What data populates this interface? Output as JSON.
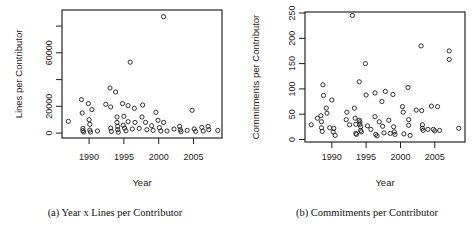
{
  "figure": {
    "background": "#ffffff",
    "ink_color": "#1c1c1c",
    "marker": "open-circle"
  },
  "chart_data": [
    {
      "type": "scatter",
      "caption": "(a) Year x Lines per Contributor",
      "xlabel": "Year",
      "ylabel": "Lines per Contributor",
      "xlim": [
        1986.1,
        2009.1
      ],
      "ylim": [
        -3700,
        92000
      ],
      "xticks": [
        1990,
        1995,
        2000,
        2005
      ],
      "xtick_labels": [
        "1990",
        "1995",
        "2000",
        "2005"
      ],
      "yticks": [
        0,
        20000,
        40000,
        60000,
        80000
      ],
      "ytick_labels": [
        "0",
        "20000",
        "",
        "60000",
        ""
      ],
      "points": [
        [
          1987.0,
          8800
        ],
        [
          1988.9,
          25000
        ],
        [
          1989.0,
          15000
        ],
        [
          1989.1,
          3500
        ],
        [
          1989.1,
          1800
        ],
        [
          1989.2,
          700
        ],
        [
          1989.9,
          22000
        ],
        [
          1990.0,
          10000
        ],
        [
          1990.1,
          6500
        ],
        [
          1990.1,
          2200
        ],
        [
          1990.2,
          700
        ],
        [
          1990.4,
          17500
        ],
        [
          1991.2,
          1500
        ],
        [
          1992.4,
          21500
        ],
        [
          1993.0,
          33700
        ],
        [
          1993.8,
          30700
        ],
        [
          1993.1,
          19500
        ],
        [
          1993.1,
          3700
        ],
        [
          1993.2,
          1200
        ],
        [
          1994.0,
          12000
        ],
        [
          1994.0,
          8000
        ],
        [
          1994.1,
          5000
        ],
        [
          1994.1,
          2500
        ],
        [
          1994.2,
          600
        ],
        [
          1994.8,
          22000
        ],
        [
          1994.9,
          5800
        ],
        [
          1995.0,
          12500
        ],
        [
          1995.1,
          3700
        ],
        [
          1995.3,
          1700
        ],
        [
          1995.6,
          20500
        ],
        [
          1995.6,
          8500
        ],
        [
          1995.9,
          53000
        ],
        [
          1996.2,
          3000
        ],
        [
          1996.5,
          18500
        ],
        [
          1996.6,
          8000
        ],
        [
          1997.2,
          3500
        ],
        [
          1997.6,
          12000
        ],
        [
          1997.7,
          21000
        ],
        [
          1998.1,
          8000
        ],
        [
          1998.3,
          2500
        ],
        [
          1999.0,
          5500
        ],
        [
          1999.2,
          2000
        ],
        [
          1999.6,
          15500
        ],
        [
          1999.9,
          9500
        ],
        [
          2000.1,
          4000
        ],
        [
          2000.3,
          1500
        ],
        [
          2000.7,
          87000
        ],
        [
          2000.7,
          8000
        ],
        [
          2001.2,
          1500
        ],
        [
          2002.2,
          3000
        ],
        [
          2003.0,
          5000
        ],
        [
          2003.1,
          2500
        ],
        [
          2003.2,
          1000
        ],
        [
          2004.1,
          2000
        ],
        [
          2004.8,
          17000
        ],
        [
          2005.1,
          3000
        ],
        [
          2005.3,
          1200
        ],
        [
          2006.2,
          4200
        ],
        [
          2006.4,
          1500
        ],
        [
          2007.1,
          5000
        ],
        [
          2007.2,
          2500
        ],
        [
          2008.5,
          2000
        ]
      ]
    },
    {
      "type": "scatter",
      "caption": "(b) Commitments per Contributor",
      "xlabel": "Year",
      "ylabel": "Commitments per Contributor",
      "xlim": [
        1986.1,
        2009.4
      ],
      "ylim": [
        -5,
        252
      ],
      "xticks": [
        1990,
        1995,
        2000,
        2005
      ],
      "xtick_labels": [
        "1990",
        "1995",
        "2000",
        "2005"
      ],
      "yticks": [
        0,
        50,
        100,
        150,
        200,
        250
      ],
      "ytick_labels": [
        "0",
        "50",
        "100",
        "150",
        "200",
        "250"
      ],
      "points": [
        [
          1987.0,
          29
        ],
        [
          1987.9,
          42
        ],
        [
          1988.4,
          47
        ],
        [
          1988.5,
          35
        ],
        [
          1988.5,
          23
        ],
        [
          1988.6,
          16
        ],
        [
          1988.7,
          108
        ],
        [
          1988.8,
          87
        ],
        [
          1989.2,
          62
        ],
        [
          1989.3,
          52
        ],
        [
          1989.7,
          23
        ],
        [
          1990.0,
          78
        ],
        [
          1990.2,
          15
        ],
        [
          1990.3,
          22
        ],
        [
          1990.5,
          8
        ],
        [
          1992.1,
          39
        ],
        [
          1992.2,
          54
        ],
        [
          1992.6,
          29
        ],
        [
          1993.0,
          245
        ],
        [
          1993.3,
          62
        ],
        [
          1993.4,
          42
        ],
        [
          1993.5,
          30
        ],
        [
          1993.5,
          12
        ],
        [
          1993.6,
          10
        ],
        [
          1994.0,
          114
        ],
        [
          1994.0,
          38
        ],
        [
          1994.1,
          35
        ],
        [
          1994.1,
          30
        ],
        [
          1994.2,
          25
        ],
        [
          1994.2,
          18
        ],
        [
          1994.3,
          15
        ],
        [
          1994.9,
          150
        ],
        [
          1995.0,
          88
        ],
        [
          1995.2,
          27
        ],
        [
          1995.7,
          20
        ],
        [
          1996.3,
          92
        ],
        [
          1996.3,
          45
        ],
        [
          1996.4,
          10
        ],
        [
          1996.6,
          7
        ],
        [
          1996.9,
          35
        ],
        [
          1997.3,
          75
        ],
        [
          1997.4,
          26
        ],
        [
          1997.6,
          13
        ],
        [
          1997.8,
          95
        ],
        [
          1998.3,
          38
        ],
        [
          1998.5,
          12
        ],
        [
          1998.9,
          89
        ],
        [
          1999.0,
          25
        ],
        [
          1999.1,
          15
        ],
        [
          1999.2,
          10
        ],
        [
          2000.3,
          65
        ],
        [
          2000.4,
          54
        ],
        [
          2000.5,
          11
        ],
        [
          2001.1,
          103
        ],
        [
          2001.2,
          39
        ],
        [
          2001.2,
          28
        ],
        [
          2001.4,
          8
        ],
        [
          2002.3,
          58
        ],
        [
          2003.0,
          185
        ],
        [
          2003.1,
          57
        ],
        [
          2003.2,
          29
        ],
        [
          2003.2,
          22
        ],
        [
          2003.3,
          18
        ],
        [
          2004.0,
          20
        ],
        [
          2004.5,
          66
        ],
        [
          2004.8,
          20
        ],
        [
          2005.0,
          17
        ],
        [
          2005.4,
          65
        ],
        [
          2005.7,
          18
        ],
        [
          2007.1,
          175
        ],
        [
          2007.1,
          158
        ],
        [
          2008.5,
          22
        ]
      ]
    }
  ]
}
